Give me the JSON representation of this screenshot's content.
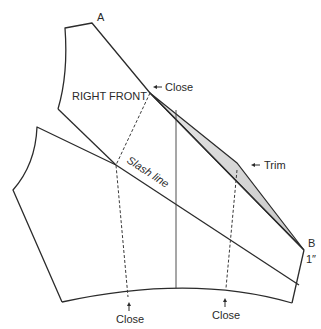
{
  "diagram": {
    "labels": {
      "vertex_a": "A",
      "vertex_b": "B",
      "measure_b": "1″",
      "piece_name": "RIGHT FRONT",
      "close_top": "Close",
      "slash_line": "Slash line",
      "trim": "Trim",
      "close_bottom_left": "Close",
      "close_bottom_right": "Close"
    },
    "colors": {
      "line": "#2b2b2b",
      "trim_fill": "#d9d9d9",
      "background": "#ffffff"
    },
    "icons": {
      "close_top_arrow": "arrow-left-icon",
      "trim_arrow": "arrow-left-icon",
      "close_bottom_left_arrow": "arrow-up-icon",
      "close_bottom_right_arrow": "arrow-up-icon"
    }
  }
}
